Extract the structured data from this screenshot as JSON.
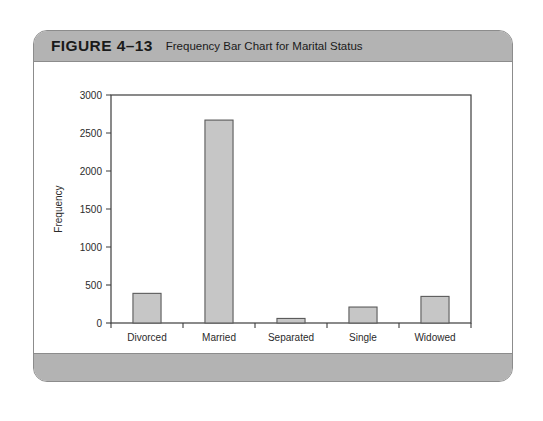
{
  "figure": {
    "number": "FIGURE 4–13",
    "caption": "Frequency Bar Chart for Marital Status"
  },
  "colors": {
    "header_bar": "#b3b3b3",
    "footer_bar": "#b3b3b3",
    "card_border": "#8c8c8c",
    "bar_fill": "#c6c6c6",
    "bar_stroke": "#5a5a5a",
    "axis": "#3c3c3c"
  },
  "chart_data": {
    "type": "bar",
    "title": "Frequency Bar Chart for Marital Status",
    "categories": [
      "Divorced",
      "Married",
      "Separated",
      "Single",
      "Widowed"
    ],
    "values": [
      390,
      2670,
      60,
      210,
      350
    ],
    "xlabel": "Marital Status",
    "ylabel": "Frequency",
    "ylim": [
      0,
      3000
    ],
    "ytick_step": 500,
    "yticks": [
      "0",
      "500",
      "1000",
      "1500",
      "2000",
      "2500",
      "3000"
    ],
    "grid": false,
    "legend": false
  }
}
